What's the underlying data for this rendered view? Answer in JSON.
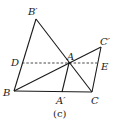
{
  "figure": {
    "caption": "(c)",
    "points": {
      "B_prime": "B′",
      "B": "B",
      "C": "C",
      "C_prime": "C′",
      "A": "A",
      "A_prime": "A′",
      "D": "D",
      "E": "E"
    },
    "segments": [
      {
        "from": "B_prime",
        "to": "B",
        "style": "solid"
      },
      {
        "from": "B_prime",
        "to": "C",
        "style": "solid"
      },
      {
        "from": "B",
        "to": "C",
        "style": "solid"
      },
      {
        "from": "B",
        "to": "C_prime",
        "style": "solid"
      },
      {
        "from": "C_prime",
        "to": "C",
        "style": "solid"
      },
      {
        "from": "A",
        "to": "A_prime",
        "style": "solid"
      },
      {
        "from": "D",
        "to": "E",
        "style": "dashed"
      }
    ]
  }
}
